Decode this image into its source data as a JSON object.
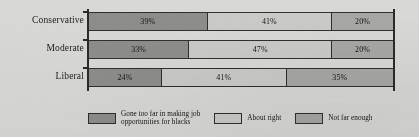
{
  "chart_data": {
    "type": "bar",
    "orientation": "horizontal",
    "stacked": true,
    "stack_unit": "percent",
    "title": "",
    "subtitle": "",
    "xlabel": "",
    "ylabel": "",
    "xlim": [
      0,
      100
    ],
    "grid": false,
    "legend_position": "bottom",
    "categories": [
      "Conservative",
      "Moderate",
      "Liberal"
    ],
    "series": [
      {
        "name": "Gone too far in making job\nopportunities for blacks",
        "color": "#8d8d8b",
        "values": [
          39,
          33,
          24
        ],
        "labels": [
          "39%",
          "33%",
          "24%"
        ]
      },
      {
        "name": "About right",
        "color": "#cacac7",
        "values": [
          41,
          47,
          41
        ],
        "labels": [
          "41%",
          "47%",
          "41%"
        ]
      },
      {
        "name": "Not far enough",
        "color": "#a7a7a4",
        "values": [
          20,
          20,
          35
        ],
        "labels": [
          "20%",
          "20%",
          "35%"
        ]
      }
    ],
    "rows": [
      {
        "category": "Conservative",
        "segments": [
          {
            "series": "Gone too far in making job opportunities for blacks",
            "value": 39,
            "label": "39%"
          },
          {
            "series": "About right",
            "value": 41,
            "label": "41%"
          },
          {
            "series": "Not far enough",
            "value": 20,
            "label": "20%"
          }
        ]
      },
      {
        "category": "Moderate",
        "segments": [
          {
            "series": "Gone too far in making job opportunities for blacks",
            "value": 33,
            "label": "33%"
          },
          {
            "series": "About right",
            "value": 47,
            "label": "47%"
          },
          {
            "series": "Not far enough",
            "value": 20,
            "label": "20%"
          }
        ]
      },
      {
        "category": "Liberal",
        "segments": [
          {
            "series": "Gone too far in making job opportunities for blacks",
            "value": 24,
            "label": "24%"
          },
          {
            "series": "About right",
            "value": 41,
            "label": "41%"
          },
          {
            "series": "Not far enough",
            "value": 35,
            "label": "35%"
          }
        ]
      }
    ],
    "legend": [
      {
        "label": "Gone too far in making job\nopportunities for blacks",
        "color": "#8d8d8b"
      },
      {
        "label": "About right",
        "color": "#cacac7"
      },
      {
        "label": "Not far enough",
        "color": "#a7a7a4"
      }
    ]
  },
  "colors": {
    "background": "#d8d8d6",
    "axis": "#2a2a2a",
    "text": "#1a1a1a",
    "segment_gone_too_far": "#8d8d8b",
    "segment_about_right": "#cacac7",
    "segment_not_far_enough": "#a7a7a4"
  }
}
